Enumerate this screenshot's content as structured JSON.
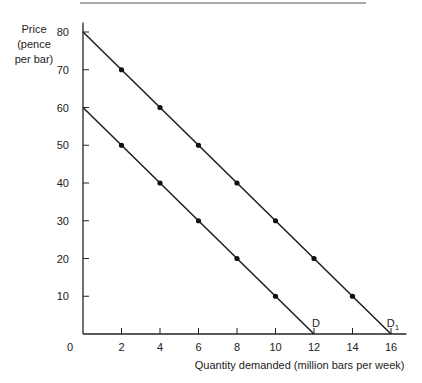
{
  "chart_data": {
    "type": "line",
    "title": "",
    "xlabel": "Quantity demanded (million bars per week)",
    "ylabel": [
      "Price",
      "(pence",
      "per bar)"
    ],
    "xlim": [
      0,
      16
    ],
    "ylim": [
      0,
      80
    ],
    "x_ticks": [
      2,
      4,
      6,
      8,
      10,
      12,
      14,
      16
    ],
    "y_ticks": [
      10,
      20,
      30,
      40,
      50,
      60,
      70,
      80
    ],
    "origin_label": "0",
    "grid": false,
    "series": [
      {
        "name": "D",
        "label": "D",
        "points": [
          [
            0,
            60
          ],
          [
            2,
            50
          ],
          [
            4,
            40
          ],
          [
            6,
            30
          ],
          [
            8,
            20
          ],
          [
            10,
            10
          ],
          [
            12,
            0
          ]
        ]
      },
      {
        "name": "D1",
        "label": "D",
        "label_sub": "1",
        "points": [
          [
            0,
            80
          ],
          [
            2,
            70
          ],
          [
            4,
            60
          ],
          [
            6,
            50
          ],
          [
            8,
            40
          ],
          [
            10,
            30
          ],
          [
            12,
            20
          ],
          [
            14,
            10
          ],
          [
            16,
            0
          ]
        ]
      }
    ]
  }
}
